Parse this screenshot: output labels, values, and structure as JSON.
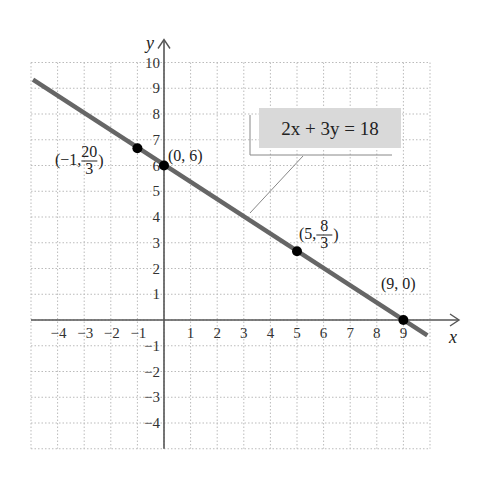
{
  "chart_data": {
    "type": "line",
    "title": "",
    "equation_label": "2x + 3y = 18",
    "xlabel": "x",
    "ylabel": "y",
    "xlim": [
      -5,
      10
    ],
    "ylim": [
      -5,
      10
    ],
    "grid": true,
    "x_ticks": [
      -4,
      -3,
      -2,
      -1,
      1,
      2,
      3,
      4,
      5,
      6,
      7,
      8,
      9
    ],
    "y_ticks": [
      -4,
      -3,
      -2,
      -1,
      1,
      2,
      3,
      4,
      5,
      6,
      7,
      8,
      9,
      10
    ],
    "x_tick_labels": [
      "−4",
      "−3",
      "−2",
      "−1",
      "1",
      "2",
      "3",
      "4",
      "5",
      "6",
      "7",
      "8",
      "9"
    ],
    "y_tick_labels": [
      "−4",
      "−3",
      "−2",
      "−1",
      "1",
      "2",
      "3",
      "4",
      "5",
      "6",
      "7",
      "8",
      "9",
      "10"
    ],
    "series": [
      {
        "name": "2x + 3y = 18",
        "x": [
          -5,
          10
        ],
        "y": [
          9.333,
          -0.667
        ],
        "color": "#666666"
      }
    ],
    "points": [
      {
        "x": -1,
        "y": 6.667,
        "label_main": "(−1, ",
        "label_num": "20",
        "label_den": "3",
        "label_close": ")"
      },
      {
        "x": 0,
        "y": 6,
        "label": "(0, 6)"
      },
      {
        "x": 5,
        "y": 2.667,
        "label_main": "(5, ",
        "label_num": "8",
        "label_den": "3",
        "label_close": ")"
      },
      {
        "x": 9,
        "y": 0,
        "label": "(9, 0)"
      }
    ],
    "colors": {
      "line": "#666666",
      "axis": "#555555",
      "grid": "#bbbbbb",
      "point": "#000000",
      "label_box": "#d9d9d9"
    }
  }
}
